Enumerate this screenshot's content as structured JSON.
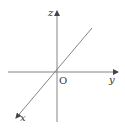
{
  "diagram": {
    "type": "3d-coordinate-axes",
    "axes": [
      {
        "name": "z",
        "label": "z",
        "direction": "up"
      },
      {
        "name": "y",
        "label": "y",
        "direction": "right"
      },
      {
        "name": "x",
        "label": "x",
        "direction": "down-left"
      }
    ],
    "origin_label": "O",
    "colors": {
      "line": "#555555",
      "text": "#333333",
      "background": "#ffffff"
    }
  }
}
